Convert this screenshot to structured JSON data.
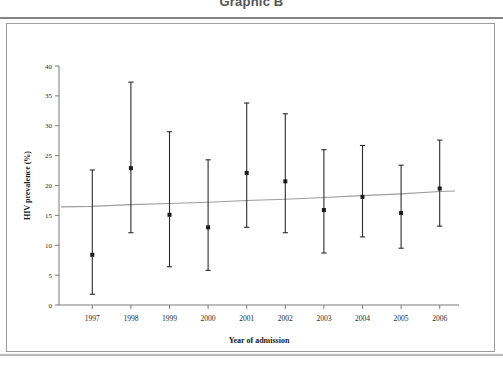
{
  "title": "Graphic B",
  "chart_data": {
    "type": "scatter",
    "title": "Graphic B",
    "xlabel": "Year of admission",
    "ylabel": "HIV prevalence (%)",
    "xlim": [
      1996.4,
      2006.6
    ],
    "ylim": [
      0,
      40
    ],
    "ytick_step": 5,
    "grid": false,
    "legend": null,
    "error_bar_style": "vertical-with-caps",
    "categories": [
      "1997",
      "1998",
      "1999",
      "2000",
      "2001",
      "2002",
      "2003",
      "2004",
      "2005",
      "2006"
    ],
    "ytick_labels": [
      "0",
      "5",
      "10",
      "15",
      "20",
      "25",
      "30",
      "35",
      "40"
    ],
    "values": [
      8.4,
      22.9,
      15.1,
      13.0,
      22.1,
      20.7,
      15.9,
      18.1,
      15.4,
      19.5
    ],
    "lower": [
      1.8,
      12.1,
      6.4,
      5.8,
      13.0,
      12.1,
      8.7,
      11.4,
      9.5,
      13.2
    ],
    "upper": [
      22.6,
      37.3,
      29.0,
      24.3,
      33.8,
      32.0,
      26.0,
      26.7,
      23.4,
      27.6
    ],
    "series": [
      {
        "name": "HIV prevalence (%)",
        "points": [
          {
            "x": "1997",
            "y": 8.4,
            "ci_low": 1.8,
            "ci_high": 22.6
          },
          {
            "x": "1998",
            "y": 22.9,
            "ci_low": 12.1,
            "ci_high": 37.3
          },
          {
            "x": "1999",
            "y": 15.1,
            "ci_low": 6.4,
            "ci_high": 29.0
          },
          {
            "x": "2000",
            "y": 13.0,
            "ci_low": 5.8,
            "ci_high": 24.3
          },
          {
            "x": "2001",
            "y": 22.1,
            "ci_low": 13.0,
            "ci_high": 33.8
          },
          {
            "x": "2002",
            "y": 20.7,
            "ci_low": 12.1,
            "ci_high": 32.0
          },
          {
            "x": "2003",
            "y": 15.9,
            "ci_low": 8.7,
            "ci_high": 26.0
          },
          {
            "x": "2004",
            "y": 18.1,
            "ci_low": 11.4,
            "ci_high": 26.7
          },
          {
            "x": "2005",
            "y": 15.4,
            "ci_low": 9.5,
            "ci_high": 23.4
          },
          {
            "x": "2006",
            "y": 19.5,
            "ci_low": 13.2,
            "ci_high": 27.6
          }
        ]
      },
      {
        "name": "trend",
        "type": "line",
        "values": [
          16.5,
          16.8,
          17.0,
          17.2,
          17.5,
          17.7,
          18.0,
          18.3,
          18.6,
          19.0
        ]
      }
    ]
  },
  "colors": {
    "marker": "#1b1b1b",
    "errorbar": "#2c2c2c",
    "trendline": "#9d9d9d",
    "axis": "#7a7a7a",
    "frame": "#9b9b9b",
    "background": "#ffffff"
  }
}
